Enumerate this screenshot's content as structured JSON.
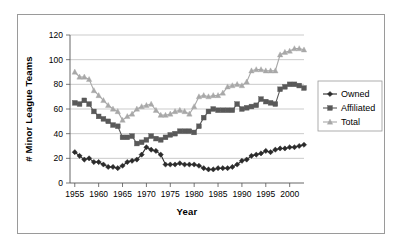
{
  "chart_data": {
    "type": "line",
    "title": "",
    "xlabel": "Year",
    "ylabel": "# Minor League Teams",
    "xlim": [
      1954,
      2003
    ],
    "ylim": [
      0,
      120
    ],
    "ytick_step": 20,
    "xtick_step": 5,
    "yticks": [
      "0",
      "20",
      "40",
      "60",
      "80",
      "100",
      "120"
    ],
    "xticks": [
      "1955",
      "1960",
      "1965",
      "1970",
      "1975",
      "1980",
      "1985",
      "1990",
      "1995",
      "2000"
    ],
    "grid": "horizontal",
    "legend_position": "right",
    "x": [
      1955,
      1956,
      1957,
      1958,
      1959,
      1960,
      1961,
      1962,
      1963,
      1964,
      1965,
      1966,
      1967,
      1968,
      1969,
      1970,
      1971,
      1972,
      1973,
      1974,
      1975,
      1976,
      1977,
      1978,
      1979,
      1980,
      1981,
      1982,
      1983,
      1984,
      1985,
      1986,
      1987,
      1988,
      1989,
      1990,
      1991,
      1992,
      1993,
      1994,
      1995,
      1996,
      1997,
      1998,
      1999,
      2000,
      2001,
      2002,
      2003
    ],
    "series": [
      {
        "name": "Owned",
        "marker": "diamond",
        "color": "#2b2b2b",
        "values": [
          25,
          22,
          19,
          20,
          17,
          17,
          15,
          13,
          13,
          12,
          14,
          17,
          18,
          19,
          23,
          29,
          27,
          26,
          23,
          15,
          15,
          15,
          16,
          15,
          15,
          15,
          14,
          12,
          11,
          11,
          12,
          12,
          12,
          13,
          15,
          18,
          19,
          22,
          23,
          24,
          26,
          25,
          27,
          28,
          28,
          29,
          29,
          30,
          31
        ]
      },
      {
        "name": "Affiliated",
        "marker": "square",
        "color": "#595959",
        "values": [
          65,
          64,
          67,
          64,
          58,
          54,
          52,
          50,
          47,
          46,
          37,
          37,
          38,
          32,
          33,
          35,
          38,
          36,
          35,
          37,
          39,
          40,
          42,
          42,
          42,
          41,
          46,
          53,
          58,
          60,
          59,
          59,
          59,
          59,
          64,
          60,
          61,
          62,
          63,
          68,
          66,
          65,
          64,
          76,
          78,
          80,
          80,
          79,
          77
        ]
      },
      {
        "name": "Total",
        "marker": "triangle",
        "color": "#a8a8a8",
        "values": [
          90,
          86,
          86,
          84,
          75,
          71,
          67,
          63,
          60,
          58,
          51,
          54,
          56,
          60,
          62,
          63,
          64,
          59,
          55,
          55,
          56,
          58,
          59,
          58,
          56,
          62,
          70,
          71,
          70,
          71,
          71,
          73,
          78,
          79,
          80,
          79,
          82,
          91,
          92,
          92,
          91,
          91,
          91,
          104,
          106,
          107,
          109,
          109,
          108
        ]
      }
    ]
  },
  "legend": {
    "items": [
      {
        "label": "Owned"
      },
      {
        "label": "Affiliated"
      },
      {
        "label": "Total"
      }
    ]
  }
}
